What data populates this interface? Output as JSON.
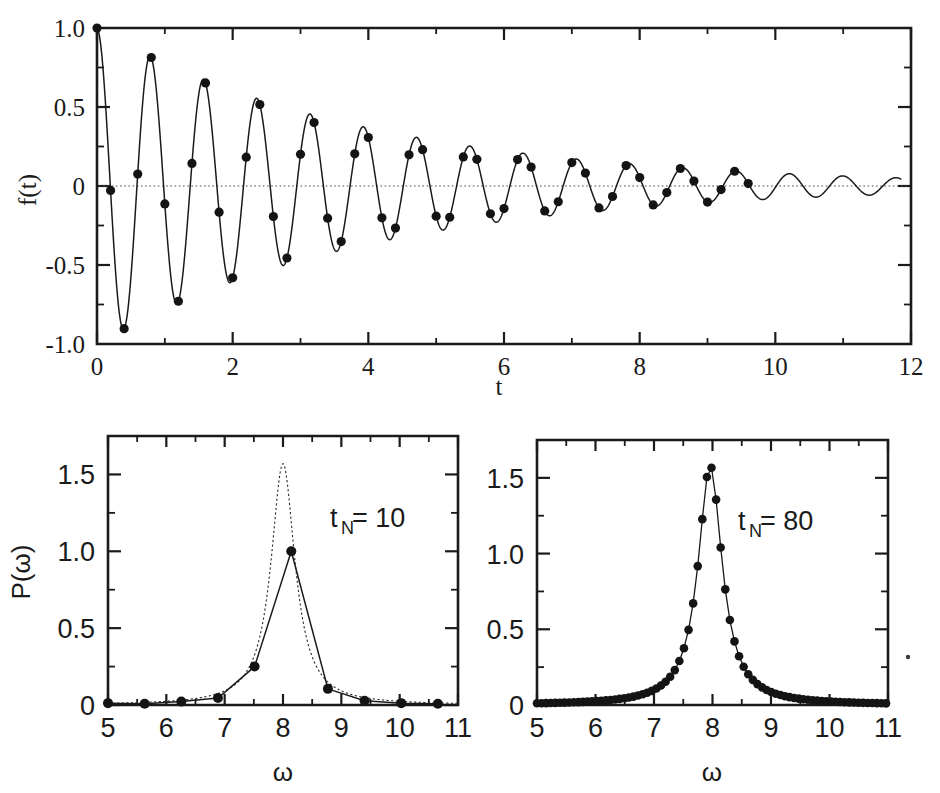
{
  "figure": {
    "background": "#ffffff",
    "ink": "#1a1a1a"
  },
  "chart_data": [
    {
      "id": "top-damped-oscillation",
      "type": "line",
      "title": "",
      "xlabel": "t",
      "ylabel": "f(t)",
      "xlim": [
        0,
        12
      ],
      "ylim": [
        -1.0,
        1.0
      ],
      "xticks": [
        0,
        2,
        4,
        6,
        8,
        10,
        12
      ],
      "xticklabels": [
        "0",
        "2",
        "4",
        "6",
        "8",
        "10",
        "12"
      ],
      "yticks": [
        -1.0,
        -0.5,
        0,
        0.5,
        1.0
      ],
      "yticklabels": [
        "-1.0",
        "-0.5",
        "0",
        "0.5",
        "1.0"
      ],
      "xminorticks": [
        1,
        3,
        5,
        7,
        9,
        11
      ],
      "yminorticks": [
        -0.75,
        -0.25,
        0.25,
        0.75
      ],
      "grid": false,
      "legend": null,
      "zero_reference_line": 0,
      "series": [
        {
          "name": "f(t) = exp(-t/4) cos(8t)",
          "style": "solid-curve",
          "formula": "exp(-0.25*t)*cos(8*t)",
          "t_start": 0,
          "t_end": 11.85,
          "has_markers": false
        },
        {
          "name": "sampled points",
          "style": "filled-circles",
          "marker_interval": 0.2,
          "marker_t_start": 0,
          "marker_t_end": 9.6,
          "formula": "exp(-0.25*t)*cos(8*t)"
        }
      ]
    },
    {
      "id": "bottom-left-spectrum",
      "type": "line",
      "title": "",
      "annotation": "t",
      "annotation_sub": "N",
      "annotation_tail": " = 10",
      "xlabel": "ω",
      "ylabel": "P(ω)",
      "xlim": [
        5,
        11
      ],
      "ylim": [
        0,
        1.75
      ],
      "xticks": [
        5,
        6,
        7,
        8,
        9,
        10,
        11
      ],
      "xticklabels": [
        "5",
        "6",
        "7",
        "8",
        "9",
        "10",
        "11"
      ],
      "yticks": [
        0,
        0.5,
        1.0,
        1.5
      ],
      "yticklabels": [
        "0",
        "0.5",
        "1.0",
        "1.5"
      ],
      "xminorticks": [
        5.5,
        6.5,
        7.5,
        8.5,
        9.5,
        10.5
      ],
      "yminorticks": [
        0.25,
        0.75,
        1.25
      ],
      "grid": false,
      "series": [
        {
          "name": "discrete power spectrum (t_N = 10)",
          "style": "solid-with-markers",
          "x": [
            5.0,
            5.628,
            6.257,
            6.885,
            7.513,
            8.142,
            8.77,
            9.398,
            10.027,
            10.655
          ],
          "y": [
            0.012,
            0.008,
            0.022,
            0.045,
            0.25,
            1.0,
            0.105,
            0.028,
            0.012,
            0.008
          ]
        },
        {
          "name": "continuous Lorentzian reference",
          "style": "dotted",
          "peak_x": 8.0,
          "peak_y": 1.57,
          "hwhm": 0.25,
          "formula": "1.57/(1+((w-8.0)/0.25)^2)"
        }
      ]
    },
    {
      "id": "bottom-right-spectrum",
      "type": "line",
      "title": "",
      "annotation": "t",
      "annotation_sub": "N",
      "annotation_tail": " = 80",
      "xlabel": "ω",
      "ylabel": "P(ω)",
      "xlim": [
        5,
        11
      ],
      "ylim": [
        0,
        1.75
      ],
      "xticks": [
        5,
        6,
        7,
        8,
        9,
        10,
        11
      ],
      "xticklabels": [
        "5",
        "6",
        "7",
        "8",
        "9",
        "10",
        "11"
      ],
      "yticks": [
        0,
        0.5,
        1.0,
        1.5
      ],
      "yticklabels": [
        "0",
        "0.5",
        "1.0",
        "1.5"
      ],
      "xminorticks": [
        5.5,
        6.5,
        7.5,
        8.5,
        9.5,
        10.5
      ],
      "yminorticks": [
        0.25,
        0.75,
        1.25
      ],
      "grid": false,
      "series": [
        {
          "name": "discrete power spectrum (t_N = 80)",
          "style": "solid-with-markers",
          "marker_interval": 0.0785,
          "x_start": 5.0,
          "x_end": 11.0,
          "peak_x": 7.96,
          "peak_y": 1.58,
          "hwhm": 0.25,
          "formula": "1.58/(1+((w-7.96)/0.25)^2)",
          "notable_points": [
            {
              "x": 7.57,
              "y": 0.33
            },
            {
              "x": 7.65,
              "y": 0.48
            },
            {
              "x": 7.73,
              "y": 0.7
            },
            {
              "x": 7.8,
              "y": 1.02
            },
            {
              "x": 7.88,
              "y": 1.41
            },
            {
              "x": 7.96,
              "y": 1.58
            },
            {
              "x": 8.04,
              "y": 1.32
            },
            {
              "x": 8.12,
              "y": 0.93
            },
            {
              "x": 8.2,
              "y": 0.64
            },
            {
              "x": 8.27,
              "y": 0.45
            },
            {
              "x": 8.35,
              "y": 0.33
            }
          ]
        }
      ]
    }
  ]
}
